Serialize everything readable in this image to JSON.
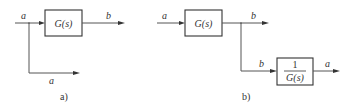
{
  "diagram_a": {
    "caption": "a)",
    "block": {
      "label": "G(s)"
    },
    "input_label": "a",
    "output_label": "b",
    "branch_label": "a"
  },
  "diagram_b": {
    "caption": "b)",
    "block1": {
      "label": "G(s)"
    },
    "block2": {
      "numerator": "1",
      "denominator": "G(s)"
    },
    "input_label": "a",
    "output_label": "b",
    "branch_label": "b",
    "branch_output_label": "a"
  },
  "colors": {
    "line": "#555555",
    "box": "#333333",
    "text": "#333333"
  }
}
